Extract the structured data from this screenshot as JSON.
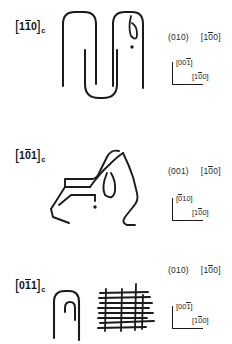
{
  "figure": {
    "background_color": "#ffffff",
    "ink_color": "#1b1b1b",
    "panels": [
      {
        "id": "panel-110",
        "zone_axis": {
          "open_bracket": "[",
          "digits": "110",
          "bar_over": "1",
          "close_bracket": "]",
          "subscript": "c",
          "full_text": "[110]c"
        },
        "indices": {
          "plane": "(010)",
          "direction_open": "[",
          "direction_digits": "100",
          "direction_bar_over": "0",
          "direction_close": "]",
          "direction_full": "[100]"
        },
        "axis_indicator": {
          "vertical_label": "[001]",
          "vertical_bar_over": "1",
          "horizontal_label": "[100]",
          "horizontal_bar_over": "0"
        },
        "sketch_description": "chain-fold loops: tall inverted-U, central U fold, second inverted-U with tight teardrop loop and dot"
      },
      {
        "id": "panel-101",
        "zone_axis": {
          "open_bracket": "[",
          "digits": "101",
          "bar_over": "0",
          "close_bracket": "]",
          "subscript": "c",
          "full_text": "[101]c"
        },
        "indices": {
          "plane": "(001)",
          "direction_open": "[",
          "direction_digits": "100",
          "direction_bar_over": "0",
          "direction_close": "]",
          "direction_full": "[100]"
        },
        "axis_indicator": {
          "vertical_label": "[010]",
          "vertical_bar_over": "0",
          "horizontal_label": "[100]",
          "horizontal_bar_over": "0"
        },
        "sketch_description": "angular zigzag chain with crossing strands, central teardrop loop and dot"
      },
      {
        "id": "panel-011",
        "zone_axis": {
          "open_bracket": "[",
          "digits": "011",
          "bar_over": "1",
          "close_bracket": "]",
          "subscript": "c",
          "full_text": "[011]c"
        },
        "indices": {
          "plane": "(010)",
          "direction_open": "[",
          "direction_digits": "100",
          "direction_bar_over": "0",
          "direction_close": "]",
          "direction_full": "[100]"
        },
        "axis_indicator": {
          "vertical_label": "[001]",
          "vertical_bar_over": "1",
          "horizontal_label": "[100]",
          "horizontal_bar_over": "0"
        },
        "sketch_description": "nested hairpin folds at left; dense stack of horizontal lamellar lines crossed by vertical strands at right"
      }
    ]
  }
}
